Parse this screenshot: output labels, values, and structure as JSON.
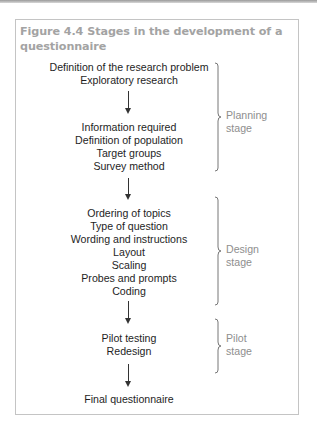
{
  "figure": {
    "number": "Figure 4.4",
    "title": "Stages in the development of a questionnaire"
  },
  "flow": {
    "group1": [
      "Definition of the research problem",
      "Exploratory research"
    ],
    "group2": [
      "Information required",
      "Definition of population",
      "Target groups",
      "Survey method"
    ],
    "group3": [
      "Ordering of topics",
      "Type of question",
      "Wording and instructions",
      "Layout",
      "Scaling",
      "Probes and prompts",
      "Coding"
    ],
    "group4": [
      "Pilot testing",
      "Redesign"
    ],
    "final": "Final questionnaire"
  },
  "stages": [
    {
      "line1": "Planning",
      "line2": "stage"
    },
    {
      "line1": "Design",
      "line2": "stage"
    },
    {
      "line1": "Pilot",
      "line2": "stage"
    }
  ],
  "icons": {
    "arrow": "down-arrow-icon",
    "bracket": "right-curly-brace-icon"
  },
  "colors": {
    "title": "#a3a3a3",
    "body_text": "#1e1e1e",
    "stage_label": "#8e8e8e",
    "frame_border": "#c4c4c4"
  }
}
